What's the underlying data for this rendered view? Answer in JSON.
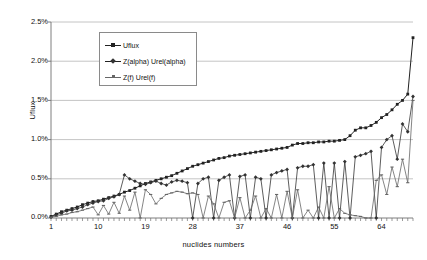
{
  "chart_data": {
    "type": "line",
    "title": "",
    "xlabel": "nuclides numbers",
    "ylabel": "Uflux",
    "xlim": [
      1,
      70
    ],
    "ylim": [
      0,
      2.5
    ],
    "yunit": "%",
    "grid": true,
    "legend_position": "top-left-inside",
    "ytick_labels": [
      "2.5%",
      "2.0%",
      "1.5%",
      "1.0%",
      "0.5%",
      "0.0%"
    ],
    "ytick_values": [
      2.5,
      2.0,
      1.5,
      1.0,
      0.5,
      0.0
    ],
    "xtick_labels": [
      "1",
      "10",
      "19",
      "28",
      "37",
      "46",
      "55",
      "64"
    ],
    "xtick_values": [
      1,
      10,
      19,
      28,
      37,
      46,
      55,
      64
    ],
    "x": [
      1,
      2,
      3,
      4,
      5,
      6,
      7,
      8,
      9,
      10,
      11,
      12,
      13,
      14,
      15,
      16,
      17,
      18,
      19,
      20,
      21,
      22,
      23,
      24,
      25,
      26,
      27,
      28,
      29,
      30,
      31,
      32,
      33,
      34,
      35,
      36,
      37,
      38,
      39,
      40,
      41,
      42,
      43,
      44,
      45,
      46,
      47,
      48,
      49,
      50,
      51,
      52,
      53,
      54,
      55,
      56,
      57,
      58,
      59,
      60,
      61,
      62,
      63,
      64,
      65,
      66,
      67,
      68,
      69,
      70
    ],
    "series": [
      {
        "name": "Uflux",
        "marker": "square",
        "color": "#222222",
        "values": [
          0.02,
          0.05,
          0.08,
          0.1,
          0.12,
          0.14,
          0.17,
          0.19,
          0.21,
          0.22,
          0.24,
          0.26,
          0.28,
          0.3,
          0.33,
          0.35,
          0.38,
          0.41,
          0.44,
          0.46,
          0.48,
          0.5,
          0.52,
          0.54,
          0.57,
          0.6,
          0.63,
          0.66,
          0.68,
          0.7,
          0.72,
          0.74,
          0.76,
          0.77,
          0.79,
          0.8,
          0.81,
          0.82,
          0.83,
          0.84,
          0.85,
          0.86,
          0.87,
          0.88,
          0.89,
          0.9,
          0.93,
          0.95,
          0.95,
          0.96,
          0.96,
          0.97,
          0.97,
          0.98,
          0.98,
          0.99,
          1.0,
          1.05,
          1.12,
          1.15,
          1.15,
          1.18,
          1.22,
          1.28,
          1.32,
          1.38,
          1.45,
          1.5,
          1.58,
          2.3
        ]
      },
      {
        "name": "Z(alpha) Urel(alpha)",
        "marker": "diamond",
        "color": "#333333",
        "values": [
          0.01,
          0.04,
          0.06,
          0.09,
          0.1,
          0.12,
          0.14,
          0.17,
          0.19,
          0.21,
          0.22,
          0.25,
          0.27,
          0.3,
          0.55,
          0.5,
          0.47,
          0.44,
          0.43,
          0.45,
          0.47,
          0.44,
          0.42,
          0.46,
          0.48,
          0.47,
          0.45,
          0.0,
          0.44,
          0.5,
          0.52,
          0.0,
          0.48,
          0.52,
          0.55,
          0.0,
          0.53,
          0.55,
          0.0,
          0.52,
          0.5,
          0.0,
          0.55,
          0.58,
          0.6,
          0.62,
          0.0,
          0.64,
          0.66,
          0.66,
          0.68,
          0.0,
          0.7,
          0.0,
          0.7,
          0.0,
          0.72,
          0.0,
          0.78,
          0.8,
          0.82,
          0.85,
          0.0,
          0.9,
          1.0,
          1.05,
          0.75,
          1.2,
          1.1,
          1.55
        ]
      },
      {
        "name": "Z(f) Urel(f)",
        "marker": "dash",
        "color": "#666666",
        "values": [
          0.01,
          0.02,
          0.04,
          0.05,
          0.07,
          0.08,
          0.1,
          0.12,
          0.14,
          0.04,
          0.16,
          0.05,
          0.2,
          0.06,
          0.28,
          0.1,
          0.33,
          0.0,
          0.36,
          0.3,
          0.18,
          0.25,
          0.3,
          0.32,
          0.34,
          0.33,
          0.31,
          0.32,
          0.3,
          0.0,
          0.28,
          0.18,
          0.0,
          0.2,
          0.22,
          0.0,
          0.26,
          0.0,
          0.1,
          0.28,
          0.0,
          0.12,
          0.0,
          0.3,
          0.0,
          0.34,
          0.0,
          0.36,
          0.0,
          0.1,
          0.0,
          0.14,
          0.0,
          0.4,
          0.0,
          0.12,
          0.06,
          0.04,
          0.03,
          0.02,
          0.0,
          0.0,
          0.48,
          0.55,
          0.3,
          0.65,
          0.4,
          0.75,
          0.45,
          1.5
        ]
      }
    ]
  }
}
